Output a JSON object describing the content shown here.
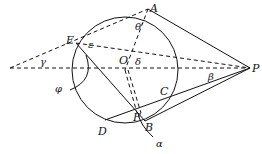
{
  "diagram": {
    "type": "geometry",
    "circle": {
      "center": "O",
      "cx": 125,
      "cy": 70,
      "r": 53
    },
    "points": {
      "A": {
        "label": "A",
        "x": 148,
        "y": 9
      },
      "P": {
        "label": "P",
        "x": 250,
        "y": 68
      },
      "E": {
        "label": "E",
        "x": 76,
        "y": 43
      },
      "O": {
        "label": "O",
        "x": 125,
        "y": 70
      },
      "C": {
        "label": "C",
        "x": 173,
        "y": 91
      },
      "D": {
        "label": "D",
        "x": 105,
        "y": 120
      },
      "F": {
        "label": "F",
        "x": 136,
        "y": 112
      },
      "B": {
        "label": "B",
        "x": 145,
        "y": 121
      }
    },
    "angles": {
      "gamma": "γ",
      "epsilon": "ε",
      "theta_prime": "θ′",
      "delta": "δ",
      "beta": "β",
      "phi": "φ",
      "alpha": "α"
    }
  }
}
